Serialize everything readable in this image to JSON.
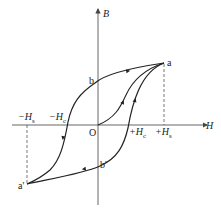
{
  "diagram": {
    "axes": {
      "x_label": "H",
      "y_label": "B"
    },
    "origin_label": "O",
    "points": {
      "a": "a",
      "a_prime": "a'",
      "b": "b",
      "b_prime": "b'"
    },
    "tick_labels": {
      "neg_Hs": "−H",
      "neg_Hs_sub": "s",
      "neg_Hc": "−H",
      "neg_Hc_sub": "c",
      "pos_Hc": "+H",
      "pos_Hc_sub": "c",
      "pos_Hs": "+H",
      "pos_Hs_sub": "s"
    },
    "colors": {
      "line": "#222222",
      "axis": "#555555"
    }
  }
}
